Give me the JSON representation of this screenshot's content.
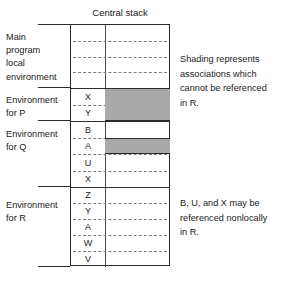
{
  "diagram": {
    "title": "Central stack",
    "left_labels": [
      {
        "id": "main",
        "lines": [
          "Main",
          "program",
          "local",
          "environment"
        ]
      },
      {
        "id": "p",
        "lines": [
          "Environment",
          "for P"
        ]
      },
      {
        "id": "q",
        "lines": [
          "Environment",
          "for Q"
        ]
      },
      {
        "id": "r",
        "lines": [
          "Environment",
          "for R"
        ]
      }
    ],
    "sections": [
      {
        "id": "main",
        "rows": [
          "",
          "",
          "",
          ""
        ]
      },
      {
        "id": "p",
        "rows": [
          "X",
          "Y"
        ]
      },
      {
        "id": "q",
        "rows": [
          "B",
          "A",
          "U",
          "X"
        ]
      },
      {
        "id": "r",
        "rows": [
          "Z",
          "Y",
          "A",
          "W",
          "V"
        ]
      }
    ],
    "shaded_blocks": [
      {
        "id": "shade-p",
        "rows": [
          "X",
          "Y"
        ]
      },
      {
        "id": "shade-q",
        "rows": [
          "A"
        ]
      }
    ],
    "notes": [
      {
        "id": "shading-note",
        "lines": [
          "Shading represents",
          "associations which",
          "cannot be referenced",
          "in R."
        ]
      },
      {
        "id": "nonlocal-note",
        "lines": [
          "B, U, and X may be",
          "referenced nonlocally",
          "in R."
        ]
      }
    ],
    "colors": {
      "shading": "#a9a9a9",
      "stroke": "#2b2b2b",
      "dash": "#7d7d7d",
      "background": "#ffffff",
      "text": "#1a1a1a"
    }
  }
}
